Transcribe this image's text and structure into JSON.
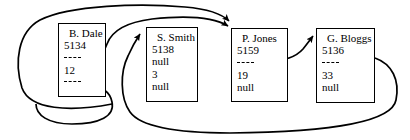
{
  "diagram": {
    "type": "node-pointer-diagram",
    "stroke_color": "#000000",
    "background_color": "#ffffff",
    "nodes": [
      {
        "id": "node-b-dale",
        "name": "B. Dale",
        "number": "5134",
        "pointer_top": "----",
        "value": "12",
        "pointer_bottom": "----",
        "x": 58,
        "y": 23,
        "w": 48,
        "h": 74
      },
      {
        "id": "node-s-smith",
        "name": "S. Smith",
        "number": "5138",
        "pointer_top": "null",
        "value": "3",
        "pointer_bottom": "null",
        "x": 146,
        "y": 27,
        "w": 52,
        "h": 75
      },
      {
        "id": "node-p-jones",
        "name": "P. Jones",
        "number": "5159",
        "pointer_top": "----",
        "value": "19",
        "pointer_bottom": "null",
        "x": 231,
        "y": 28,
        "w": 57,
        "h": 74
      },
      {
        "id": "node-g-bloggs",
        "name": "G. Bloggs",
        "number": "5136",
        "pointer_top": "----",
        "value": "33",
        "pointer_bottom": "null",
        "x": 316,
        "y": 28,
        "w": 59,
        "h": 75
      }
    ],
    "edges": [
      {
        "id": "edge-b-dale-top-to-p-jones",
        "from": "node-b-dale",
        "to": "node-p-jones",
        "arrow": true
      },
      {
        "id": "edge-outer-left-loop-to-p-jones",
        "from": "node-b-dale",
        "to": "node-p-jones",
        "arrow": true
      },
      {
        "id": "edge-b-dale-bottom-loop",
        "from": "node-b-dale",
        "to": "node-s-smith",
        "arrow": true
      },
      {
        "id": "edge-p-jones-to-g-bloggs",
        "from": "node-p-jones",
        "to": "node-g-bloggs",
        "arrow": true
      },
      {
        "id": "edge-g-bloggs-bottom-loop-to-s-smith",
        "from": "node-g-bloggs",
        "to": "node-s-smith",
        "arrow": true
      }
    ]
  }
}
